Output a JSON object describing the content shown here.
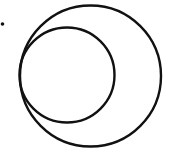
{
  "diagram": {
    "background": "#ffffff",
    "stroke_color": "#111111",
    "stroke_width": 2.4,
    "shapes": {
      "outer_circle": {
        "cx": 90.5,
        "cy": 76,
        "r": 70.5
      },
      "inner_circle": {
        "cx": 67,
        "cy": 75,
        "r": 47.5
      },
      "point": {
        "cx": 2.5,
        "cy": 24,
        "r": 1.8
      }
    },
    "relationship": "inner circle internally tangent to outer circle on the left; isolated point outside both circles"
  }
}
